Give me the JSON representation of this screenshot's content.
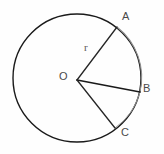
{
  "figure": {
    "background_color": "#fefefe",
    "stroke_color_primary": "#1a1a1a",
    "stroke_color_arc": "#8a8a8a",
    "label_color": "#4a4a4a"
  },
  "circle": {
    "center_x": 77,
    "center_y": 78,
    "radius": 64,
    "stroke_width": 1.4,
    "fill": "none"
  },
  "points": {
    "center": {
      "label": "O",
      "x": 77,
      "y": 80
    },
    "a": {
      "label": "A",
      "x": 117,
      "y": 27
    },
    "b": {
      "label": "B",
      "x": 140,
      "y": 92
    },
    "c": {
      "label": "C",
      "x": 115,
      "y": 128
    }
  },
  "radii": [
    {
      "name": "OA",
      "from": "O",
      "to": "A",
      "label": "r"
    },
    {
      "name": "OB",
      "from": "O",
      "to": "B",
      "label": ""
    },
    {
      "name": "OC",
      "from": "O",
      "to": "C",
      "label": ""
    }
  ],
  "arcs": [
    {
      "name": "arc-AB",
      "from": "A",
      "to": "B",
      "stroke": "#8a8a8a"
    },
    {
      "name": "arc-BC",
      "from": "B",
      "to": "C",
      "stroke": "#8a8a8a"
    }
  ],
  "labels": {
    "point_a": "A",
    "point_b": "B",
    "point_c": "C",
    "center_o": "O",
    "radius_r": "r"
  }
}
